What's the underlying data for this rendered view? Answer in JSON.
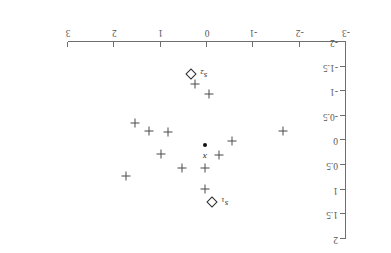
{
  "chart_data": {
    "type": "scatter",
    "title": "",
    "xlabel": "",
    "ylabel": "",
    "orientation": "rotated-180",
    "grid": false,
    "legend": "none",
    "axes": {
      "x": {
        "position": "top",
        "min": -3,
        "max": 3,
        "ticks": [
          3,
          2,
          1,
          0,
          -1,
          -2,
          -3
        ],
        "tick_labels": [
          "3",
          "2",
          "1",
          "0",
          "-1",
          "-2",
          "-3"
        ]
      },
      "y": {
        "position": "right",
        "min": -2,
        "max": 2,
        "ticks": [
          -2,
          -1.5,
          -1,
          -0.5,
          0,
          0.5,
          1,
          1.5,
          2
        ],
        "tick_labels": [
          "-2",
          "-1.5",
          "-1",
          "-0.5",
          "0",
          "0.5",
          "1",
          "1.5",
          "2"
        ]
      }
    },
    "series": [
      {
        "name": "data-points",
        "marker": "plus",
        "points": [
          {
            "x": 0.25,
            "y": -1.15
          },
          {
            "x": 1.55,
            "y": -0.35
          },
          {
            "x": 1.25,
            "y": -0.2
          },
          {
            "x": 0.85,
            "y": -0.18
          },
          {
            "x": -1.65,
            "y": -0.2
          },
          {
            "x": -0.55,
            "y": 0.02
          },
          {
            "x": 1.0,
            "y": 0.28
          },
          {
            "x": -0.25,
            "y": 0.3
          },
          {
            "x": 0.55,
            "y": 0.55
          },
          {
            "x": 0.05,
            "y": 0.55
          },
          {
            "x": 1.75,
            "y": 0.72
          },
          {
            "x": 0.05,
            "y": 0.98
          },
          {
            "x": -0.05,
            "y": -0.95
          }
        ]
      },
      {
        "name": "reference-points",
        "marker": "diamond",
        "points": [
          {
            "x": 0.35,
            "y": -1.35,
            "label": "s2"
          },
          {
            "x": -0.1,
            "y": 1.25,
            "label": "s1"
          }
        ]
      },
      {
        "name": "query-point",
        "marker": "dot",
        "points": [
          {
            "x": 0.05,
            "y": 0.1,
            "label": "x"
          }
        ]
      }
    ],
    "annotations": [
      {
        "name": "label-s2",
        "text": "s2",
        "base": "s",
        "sub": "2",
        "italic": true
      },
      {
        "name": "label-s1",
        "text": "s1",
        "base": "s",
        "sub": "1",
        "italic": true
      },
      {
        "name": "label-x",
        "text": "x",
        "base": "x",
        "sub": "",
        "italic": true
      }
    ],
    "colors": {
      "axis": "#6f6f6f",
      "tick_label": "#555555",
      "plus_marker": "#4a4a4a",
      "diamond_marker": "#2b2b2b",
      "dot_marker": "#111111",
      "background": "#ffffff"
    }
  }
}
